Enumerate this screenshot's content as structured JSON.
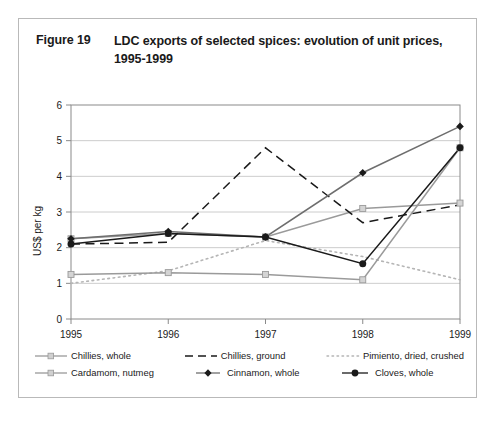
{
  "figure": {
    "number": "Figure 19",
    "title": "LDC exports of selected spices: evolution of unit prices, 1995-1999"
  },
  "chart_data": {
    "type": "line",
    "title": "LDC exports of selected spices: evolution of unit prices, 1995-1999",
    "xlabel": "",
    "ylabel": "US$ per kg",
    "categories": [
      "1995",
      "1996",
      "1997",
      "1998",
      "1999"
    ],
    "x_tick_labels": [
      "1995",
      "1996",
      "1997",
      "1998",
      "1999"
    ],
    "y_tick_labels": [
      "0",
      "1",
      "2",
      "3",
      "4",
      "5",
      "6"
    ],
    "ylim": [
      0,
      6
    ],
    "grid": "horizontal",
    "legend_position": "bottom",
    "series": [
      {
        "name": "Chillies, whole",
        "values": [
          2.25,
          2.4,
          2.3,
          3.1,
          3.25
        ],
        "color": "#9a9a9a",
        "style": "solid",
        "marker": "square-light"
      },
      {
        "name": "Chillies, ground",
        "values": [
          2.1,
          2.15,
          4.8,
          2.7,
          3.2
        ],
        "color": "#1a1a1a",
        "style": "dashed",
        "marker": "none"
      },
      {
        "name": "Pimiento, dried, crushed",
        "values": [
          1.0,
          1.35,
          2.2,
          1.75,
          1.1
        ],
        "color": "#b5b5b5",
        "style": "dotted",
        "marker": "none"
      },
      {
        "name": "Cardamom, nutmeg",
        "values": [
          1.25,
          1.3,
          1.25,
          1.1,
          4.8
        ],
        "color": "#9a9a9a",
        "style": "solid",
        "marker": "square-light"
      },
      {
        "name": "Cinnamon, whole",
        "values": [
          2.25,
          2.45,
          2.3,
          4.1,
          5.4
        ],
        "color": "#6e6e6e",
        "style": "solid",
        "marker": "diamond"
      },
      {
        "name": "Cloves, whole",
        "values": [
          2.1,
          2.4,
          2.3,
          1.55,
          4.8
        ],
        "color": "#1a1a1a",
        "style": "solid",
        "marker": "circle"
      }
    ]
  },
  "legend": {
    "items": [
      {
        "label": "Chillies, whole"
      },
      {
        "label": "Chillies, ground"
      },
      {
        "label": "Pimiento, dried, crushed"
      },
      {
        "label": "Cardamom, nutmeg"
      },
      {
        "label": "Cinnamon, whole"
      },
      {
        "label": "Cloves, whole"
      }
    ]
  }
}
